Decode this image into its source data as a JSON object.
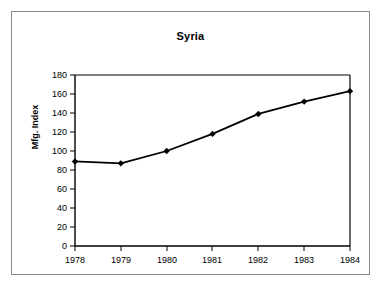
{
  "chart_data": {
    "type": "line",
    "title": "Syria",
    "xlabel": "",
    "ylabel": "Mfg. Index",
    "categories": [
      "1978",
      "1979",
      "1980",
      "1981",
      "1982",
      "1983",
      "1984"
    ],
    "values": [
      89,
      87,
      100,
      118,
      139,
      152,
      163
    ],
    "series": [
      {
        "name": "Mfg. Index",
        "values": [
          89,
          87,
          100,
          118,
          139,
          152,
          163
        ]
      }
    ],
    "ylim": [
      0,
      180
    ],
    "ytick_labels": [
      "180",
      "160",
      "140",
      "120",
      "100",
      "80",
      "60",
      "40",
      "20",
      "0"
    ],
    "ytick_values": [
      180,
      160,
      140,
      120,
      100,
      80,
      60,
      40,
      20,
      0
    ],
    "ytick_step": 20,
    "xtick_labels": [
      "1978",
      "1979",
      "1980",
      "1981",
      "1982",
      "1983",
      "1984"
    ],
    "grid": false,
    "legend": "none",
    "marker": "diamond",
    "line_color": "#000000",
    "marker_color": "#000000",
    "axis_color": "#000000",
    "plot_background": "#ffffff",
    "frame_border_color": "#8a8a8a"
  }
}
